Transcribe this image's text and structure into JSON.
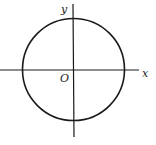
{
  "figure": {
    "type": "coordinate-plane-circle",
    "background": "#ffffff",
    "stroke_color": "#1a1a1a",
    "axes": {
      "x_label": "x",
      "y_label": "y",
      "origin_label": "O",
      "x_axis": {
        "x1": 0,
        "y1": 70,
        "x2": 139,
        "y2": 70
      },
      "y_axis": {
        "x1": 73,
        "y1": 4,
        "x2": 74,
        "y2": 137
      }
    },
    "circle": {
      "cx": 73.5,
      "cy": 69.5,
      "r": 51
    },
    "label_positions": {
      "x": {
        "x": 142,
        "y": 77
      },
      "y": {
        "x": 61,
        "y": 13
      },
      "O": {
        "x": 60,
        "y": 82
      }
    }
  }
}
